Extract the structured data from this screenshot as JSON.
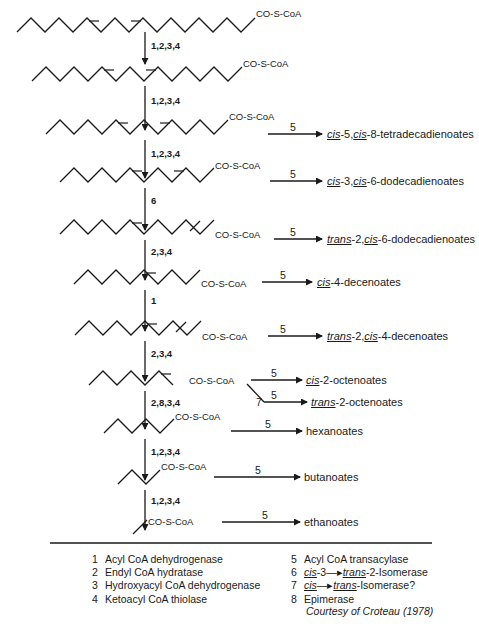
{
  "diagram": {
    "substrate_label": "CO-S-CoA",
    "steps": [
      {
        "id": "s1",
        "enzymes": "1,2,3,4",
        "coa": "CO-S-CoA",
        "product_step": "",
        "product": []
      },
      {
        "id": "s2",
        "enzymes": "1,2,3,4",
        "coa": "CO-S-CoA",
        "product_step": "",
        "product": []
      },
      {
        "id": "s3",
        "enzymes": "1,2,3,4",
        "coa": "CO-S-CoA",
        "product_step": "5",
        "product": [
          {
            "t": "cis",
            "u": true
          },
          {
            "t": "-5,",
            "u": false
          },
          {
            "t": "cis",
            "u": true
          },
          {
            "t": "-8-tetradecadienoates",
            "u": false
          }
        ]
      },
      {
        "id": "s4",
        "enzymes": "6",
        "coa": "CO-S-CoA",
        "product_step": "5",
        "product": [
          {
            "t": "cis",
            "u": true
          },
          {
            "t": "-3,",
            "u": false
          },
          {
            "t": "cis",
            "u": true
          },
          {
            "t": "-6-dodecadienoates",
            "u": false
          }
        ]
      },
      {
        "id": "s5",
        "enzymes": "2,3,4",
        "coa": "CO-S-CoA",
        "product_step": "5",
        "product": [
          {
            "t": "trans",
            "u": true
          },
          {
            "t": "-2,",
            "u": false
          },
          {
            "t": "cis",
            "u": true
          },
          {
            "t": "-6-dodecadienoates",
            "u": false
          }
        ]
      },
      {
        "id": "s6",
        "enzymes": "1",
        "coa": "CO-S-CoA",
        "product_step": "5",
        "product": [
          {
            "t": "cis",
            "u": true
          },
          {
            "t": "-4-decenoates",
            "u": false
          }
        ]
      },
      {
        "id": "s7",
        "enzymes": "2,3,4",
        "coa": "CO-S-CoA",
        "product_step": "5",
        "product": [
          {
            "t": "trans",
            "u": true
          },
          {
            "t": "-2,",
            "u": false
          },
          {
            "t": "cis",
            "u": true
          },
          {
            "t": "-4-decenoates",
            "u": false
          }
        ]
      },
      {
        "id": "s8",
        "enzymes": "2,8,3,4",
        "coa": "CO-S-CoA",
        "product_step": "5",
        "product": [
          {
            "t": "cis",
            "u": true
          },
          {
            "t": "-2-octenoates",
            "u": false
          }
        ],
        "branch_step": "7",
        "branch_product_step": "5",
        "branch_product": [
          {
            "t": "trans",
            "u": true
          },
          {
            "t": "-2-octenoates",
            "u": false
          }
        ]
      },
      {
        "id": "s9",
        "enzymes": "1,2,3,4",
        "coa": "CO-S-CoA",
        "product_step": "5",
        "product": [
          {
            "t": "hexanoates",
            "u": false
          }
        ]
      },
      {
        "id": "s10",
        "enzymes": "1,2,3,4",
        "coa": "CO-S-CoA",
        "product_step": "5",
        "product": [
          {
            "t": "butanoates",
            "u": false
          }
        ]
      },
      {
        "id": "s11",
        "enzymes": "",
        "coa": "CO-S-CoA",
        "product_step": "5",
        "product": [
          {
            "t": "ethanoates",
            "u": false
          }
        ]
      }
    ]
  },
  "legend": {
    "left": [
      {
        "num": "1",
        "label": "Acyl CoA dehydrogenase"
      },
      {
        "num": "2",
        "label": "Endyl CoA hydratase"
      },
      {
        "num": "3",
        "label": "Hydroxyacyl CoA dehydrogenase"
      },
      {
        "num": "4",
        "label": "Ketoacyl CoA thiolase"
      }
    ],
    "right": [
      {
        "num": "5",
        "parts": [
          {
            "t": "Acyl CoA transacylase",
            "u": false
          }
        ]
      },
      {
        "num": "6",
        "parts": [
          {
            "t": "cis",
            "u": true
          },
          {
            "t": "-3",
            "u": false
          },
          {
            "t": "—▸",
            "u": false,
            "arrow": true
          },
          {
            "t": "trans",
            "u": true
          },
          {
            "t": "-2-Isomerase",
            "u": false
          }
        ]
      },
      {
        "num": "7",
        "parts": [
          {
            "t": "cis",
            "u": true
          },
          {
            "t": "—▸",
            "u": false,
            "arrow": true
          },
          {
            "t": "trans",
            "u": true
          },
          {
            "t": "-Isomerase?",
            "u": false
          }
        ]
      },
      {
        "num": "8",
        "parts": [
          {
            "t": "Epimerase",
            "u": false
          }
        ]
      }
    ]
  },
  "credit": "Courtesy of Croteau (1978)"
}
